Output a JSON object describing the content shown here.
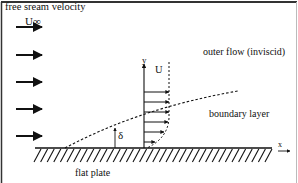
{
  "diagram": {
    "labels": {
      "free_stream": "free sream velocity",
      "u_infinity": "U∞",
      "u": "U",
      "y_axis": "y",
      "x_axis": "x",
      "outer_flow": "outer flow (inviscid)",
      "boundary_layer": "boundary layer",
      "delta": "δ",
      "flat_plate": "flat plate"
    },
    "free_stream_arrows_y": [
      27,
      55,
      82,
      109,
      136
    ],
    "profile_arrows": [
      {
        "y": 92,
        "length": 25
      },
      {
        "y": 102,
        "length": 25
      },
      {
        "y": 112,
        "length": 25
      },
      {
        "y": 122,
        "length": 24
      },
      {
        "y": 132,
        "length": 20
      },
      {
        "y": 142,
        "length": 11
      }
    ],
    "colors": {
      "ink": "#111111",
      "frame": "#333333",
      "background": "#ffffff"
    }
  }
}
